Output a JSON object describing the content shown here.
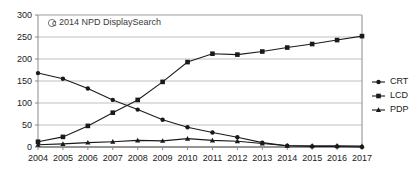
{
  "credit": {
    "symbol": "©",
    "text": "2014 NPD DisplaySearch"
  },
  "legend": {
    "position": "right",
    "entries": [
      {
        "label": "CRT",
        "marker": "circle-marker",
        "color": "#1a1a1a"
      },
      {
        "label": "LCD",
        "marker": "square-marker",
        "color": "#1a1a1a"
      },
      {
        "label": "PDP",
        "marker": "triangle-marker",
        "color": "#1a1a1a"
      }
    ]
  },
  "axes": {
    "y_ticks": [
      "0",
      "50",
      "100",
      "150",
      "200",
      "250",
      "300"
    ],
    "x_ticks": [
      "2004",
      "2005",
      "2006",
      "2007",
      "2008",
      "2009",
      "2010",
      "2011",
      "2012",
      "2013",
      "2014",
      "2015",
      "2016",
      "2017"
    ]
  },
  "colors": {
    "series": "#1a1a1a",
    "grid": "#b8b8b8",
    "axis": "#8a8a8a",
    "background": "#ffffff"
  },
  "chart_data": {
    "type": "line",
    "title": "",
    "subtitle": "",
    "xlabel": "",
    "ylabel": "",
    "grid": true,
    "legend_position": "right",
    "xlim": [
      2004,
      2017
    ],
    "ylim": [
      0,
      300
    ],
    "yticks": [
      0,
      50,
      100,
      150,
      200,
      250,
      300
    ],
    "x": [
      2004,
      2005,
      2006,
      2007,
      2008,
      2009,
      2010,
      2011,
      2012,
      2013,
      2014,
      2015,
      2016,
      2017
    ],
    "annotations": [
      "© 2014 NPD DisplaySearch"
    ],
    "series": [
      {
        "name": "CRT",
        "marker": "circle",
        "values": [
          168,
          155,
          133,
          107,
          85,
          62,
          45,
          33,
          22,
          10,
          3,
          1,
          1,
          0
        ]
      },
      {
        "name": "LCD",
        "marker": "square",
        "values": [
          12,
          23,
          48,
          78,
          107,
          148,
          193,
          212,
          210,
          217,
          226,
          234,
          243,
          252
        ]
      },
      {
        "name": "PDP",
        "marker": "triangle",
        "values": [
          5,
          7,
          10,
          12,
          15,
          14,
          19,
          15,
          13,
          8,
          3,
          3,
          3,
          2
        ]
      }
    ]
  }
}
